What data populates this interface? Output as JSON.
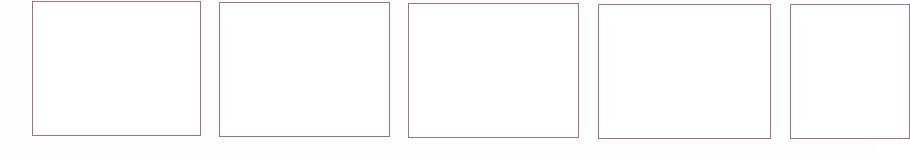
{
  "page": {
    "border_color": "#9a7088",
    "background_color": "#ffffff"
  },
  "panels": [
    {
      "index": 1,
      "label": "",
      "content": ""
    },
    {
      "index": 2,
      "label": "",
      "content": ""
    },
    {
      "index": 3,
      "label": "",
      "content": ""
    },
    {
      "index": 4,
      "label": "",
      "content": ""
    },
    {
      "index": 5,
      "label": "",
      "content": ""
    }
  ]
}
